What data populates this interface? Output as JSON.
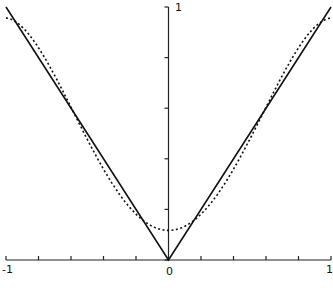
{
  "chart_data": {
    "type": "line",
    "title": "",
    "xlabel": "",
    "ylabel": "",
    "xlim": [
      -1,
      1
    ],
    "ylim": [
      0,
      1
    ],
    "x_tick_labels": [
      "-1",
      "0",
      "1"
    ],
    "y_tick_labels": [
      "1"
    ],
    "x_ticks": [
      -1,
      -0.8,
      -0.6,
      -0.4,
      -0.2,
      0,
      0.2,
      0.4,
      0.6,
      0.8,
      1
    ],
    "y_ticks": [
      0,
      0.2,
      0.4,
      0.6,
      0.8,
      1
    ],
    "grid": false,
    "series": [
      {
        "name": "|x|",
        "style": "solid",
        "x": [
          -1,
          -0.5,
          0,
          0.5,
          1
        ],
        "y": [
          1,
          0.5,
          0,
          0.5,
          1
        ]
      },
      {
        "name": "polynomial approximation",
        "style": "dotted",
        "x": [
          -1,
          -0.9,
          -0.8,
          -0.6,
          -0.4,
          -0.2,
          0,
          0.2,
          0.4,
          0.6,
          0.8,
          0.9,
          1
        ],
        "y": [
          0.957,
          0.92,
          0.84,
          0.61,
          0.36,
          0.18,
          0.117,
          0.18,
          0.36,
          0.61,
          0.84,
          0.92,
          0.957
        ]
      }
    ]
  },
  "labels": {
    "x_min": "-1",
    "x_zero": "0",
    "x_max": "1",
    "y_max": "1"
  }
}
